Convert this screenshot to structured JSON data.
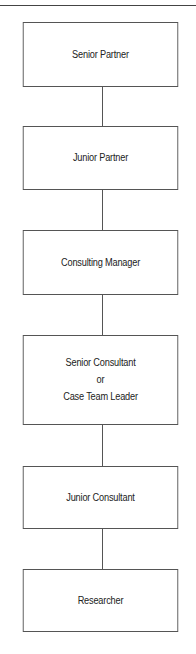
{
  "diagram": {
    "type": "org-chart-hierarchy",
    "orientation": "vertical",
    "nodes": [
      {
        "id": "senior-partner",
        "lines": [
          "Senior Partner"
        ],
        "top": 22,
        "height": 65
      },
      {
        "id": "junior-partner",
        "lines": [
          "Junior Partner"
        ],
        "top": 126,
        "height": 64
      },
      {
        "id": "consulting-manager",
        "lines": [
          "Consulting Manager"
        ],
        "top": 230,
        "height": 65
      },
      {
        "id": "senior-consultant-or-case-team-leader",
        "lines": [
          "Senior Consultant",
          "or",
          "Case Team Leader"
        ],
        "top": 335,
        "height": 90
      },
      {
        "id": "junior-consultant",
        "lines": [
          "Junior Consultant"
        ],
        "top": 466,
        "height": 63
      },
      {
        "id": "researcher",
        "lines": [
          "Researcher"
        ],
        "top": 569,
        "height": 63
      }
    ],
    "edges": [
      {
        "from": "senior-partner",
        "to": "junior-partner",
        "top": 87,
        "height": 39
      },
      {
        "from": "junior-partner",
        "to": "consulting-manager",
        "top": 190,
        "height": 40
      },
      {
        "from": "consulting-manager",
        "to": "senior-consultant-or-case-team-leader",
        "top": 295,
        "height": 40
      },
      {
        "from": "senior-consultant-or-case-team-leader",
        "to": "junior-consultant",
        "top": 425,
        "height": 41
      },
      {
        "from": "junior-consultant",
        "to": "researcher",
        "top": 529,
        "height": 40
      }
    ]
  },
  "colors": {
    "border": "#555555",
    "text": "#222222",
    "background": "#ffffff"
  }
}
